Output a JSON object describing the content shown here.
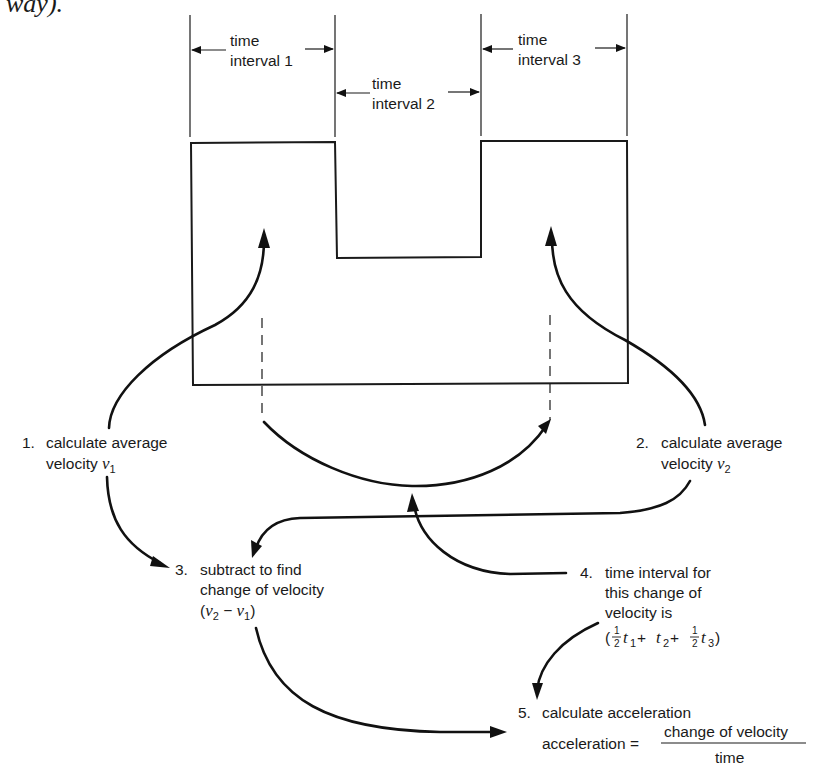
{
  "header_fragment": "way).",
  "intervals": [
    {
      "line1": "time",
      "line2": "interval 1"
    },
    {
      "line1": "time",
      "line2": "interval 2"
    },
    {
      "line1": "time",
      "line2": "interval 3"
    }
  ],
  "steps": {
    "step1": {
      "number": "1.",
      "line1": "calculate average",
      "line2_text": "velocity ",
      "var": "v",
      "sub": "1"
    },
    "step2": {
      "number": "2.",
      "line1": "calculate average",
      "line2_text": "velocity ",
      "var": "v",
      "sub": "2"
    },
    "step3": {
      "number": "3.",
      "line1": "subtract to find",
      "line2": "change of velocity",
      "formula": {
        "open": "(",
        "v": "v",
        "sub_a": "2",
        "minus": " − ",
        "sub_b": "1",
        "close": ")"
      }
    },
    "step4": {
      "number": "4.",
      "line1": "time interval for",
      "line2": "this change of",
      "line3": "velocity is",
      "formula": {
        "open": "(",
        "half": "1",
        "half_den": "2",
        "t": "t",
        "s1": "1",
        "plus": " + ",
        "s2": "2",
        "s3": "3",
        "close": ")"
      }
    },
    "step5": {
      "number": "5.",
      "line1": "calculate acceleration",
      "lhs": "acceleration =",
      "numerator": "change of velocity",
      "denominator": "time"
    }
  }
}
